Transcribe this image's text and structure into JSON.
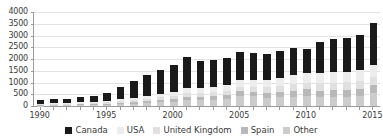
{
  "chart_data": {
    "type": "bar",
    "stacked": true,
    "title": "",
    "subtitle": "",
    "xlabel": "",
    "ylabel": "",
    "grid": true,
    "legend_position": "bottom",
    "xlim": [
      1990,
      2015
    ],
    "ylim": [
      0,
      4000
    ],
    "ytick_values": [
      0,
      500,
      1000,
      1500,
      2000,
      2500,
      3000,
      3500,
      4000
    ],
    "ytick_labels": [
      "0",
      "500",
      "1000",
      "1500",
      "2000",
      "2500",
      "3000",
      "3500",
      "4000"
    ],
    "categories": [
      1990,
      1991,
      1992,
      1993,
      1994,
      1995,
      1996,
      1997,
      1998,
      1999,
      2000,
      2001,
      2002,
      2003,
      2004,
      2005,
      2006,
      2007,
      2008,
      2009,
      2010,
      2011,
      2012,
      2013,
      2014,
      2015
    ],
    "xtick_labels": [
      "1990",
      "1995",
      "2000",
      "2005",
      "2010",
      "2015"
    ],
    "xtick_label_values": [
      1990,
      1995,
      2000,
      2005,
      2010,
      2015
    ],
    "series": [
      {
        "name": "Canada",
        "color": "#1a1a1a",
        "values": [
          170,
          190,
          200,
          240,
          250,
          330,
          540,
          700,
          870,
          1010,
          1140,
          1330,
          1170,
          1160,
          1160,
          1210,
          1120,
          1080,
          1150,
          1140,
          1010,
          1330,
          1420,
          1420,
          1490,
          1780
        ]
      },
      {
        "name": "USA",
        "color": "#ededed",
        "values": [
          35,
          38,
          40,
          55,
          60,
          70,
          90,
          110,
          135,
          160,
          180,
          210,
          215,
          230,
          255,
          285,
          300,
          320,
          350,
          395,
          410,
          430,
          450,
          455,
          470,
          500
        ]
      },
      {
        "name": "United Kingdom",
        "color": "#e0e0e0",
        "values": [
          25,
          27,
          29,
          38,
          42,
          50,
          65,
          80,
          95,
          115,
          130,
          150,
          155,
          165,
          180,
          200,
          215,
          230,
          250,
          280,
          295,
          310,
          320,
          325,
          335,
          355
        ]
      },
      {
        "name": "Spain",
        "color": "#b8b8b8",
        "values": [
          20,
          22,
          24,
          32,
          36,
          44,
          58,
          70,
          85,
          100,
          115,
          135,
          140,
          150,
          165,
          185,
          195,
          210,
          230,
          255,
          270,
          285,
          295,
          300,
          310,
          330
        ]
      },
      {
        "name": "Other",
        "color": "#cccccc",
        "values": [
          20,
          23,
          27,
          35,
          42,
          56,
          77,
          100,
          125,
          155,
          185,
          255,
          250,
          265,
          290,
          440,
          410,
          360,
          370,
          390,
          435,
          375,
          385,
          380,
          405,
          565
        ]
      }
    ],
    "totals": [
      270,
      300,
      320,
      400,
      430,
      550,
      830,
      1060,
      1310,
      1540,
      1750,
      2080,
      1930,
      1970,
      2050,
      2320,
      2240,
      2200,
      2350,
      2460,
      2420,
      2730,
      2870,
      2880,
      3010,
      3530
    ]
  },
  "legend": {
    "items": [
      {
        "label": "Canada",
        "color": "#1a1a1a"
      },
      {
        "label": "USA",
        "color": "#ededed"
      },
      {
        "label": "United Kingdom",
        "color": "#e0e0e0"
      },
      {
        "label": "Spain",
        "color": "#b8b8b8"
      },
      {
        "label": "Other",
        "color": "#cccccc"
      }
    ]
  },
  "axis_colors": {
    "axis_line": "#9a9a9a",
    "gridline": "#e2e2e2",
    "text": "#3a3a3a",
    "background": "#ffffff"
  }
}
